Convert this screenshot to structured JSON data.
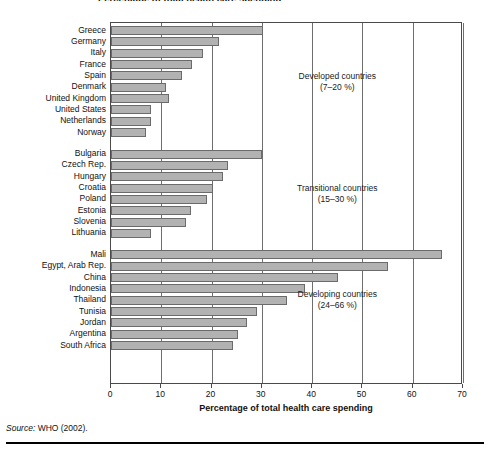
{
  "figure": {
    "title": "Percentage of total health care spending",
    "source_prefix": "Source:",
    "source_text": " WHO (2002)."
  },
  "axis": {
    "x_title": "Percentage of total health care spending",
    "x_ticks": [
      "0",
      "10",
      "20",
      "30",
      "40",
      "50",
      "60",
      "70"
    ]
  },
  "annotations": [
    {
      "line1": "Developed countries",
      "line2": "(7–20 %)"
    },
    {
      "line1": "Transitional countries",
      "line2": "(15–30 %)"
    },
    {
      "line1": "Developing countries",
      "line2": "(24–66 %)"
    }
  ],
  "chart_data": {
    "type": "bar",
    "orientation": "horizontal",
    "title": "Percentage of total health care spending",
    "xlabel": "Percentage of total health care spending",
    "ylabel": "",
    "xlim": [
      0,
      70
    ],
    "grid": true,
    "legend": "none",
    "bar_color": "#b2b2b2",
    "bar_border_color": "#6b6b6b",
    "groups": [
      {
        "name": "Developed countries",
        "range_label": "(7–20 %)",
        "categories": [
          "Greece",
          "Germany",
          "Italy",
          "France",
          "Spain",
          "Denmark",
          "United Kingdom",
          "United States",
          "Netherlands",
          "Norway"
        ],
        "values": [
          30.2,
          21.5,
          18.2,
          16.2,
          14.2,
          11.0,
          11.6,
          8.0,
          8.0,
          7.0
        ]
      },
      {
        "name": "Transitional countries",
        "range_label": "(15–30 %)",
        "categories": [
          "Bulgaria",
          "Czech Rep.",
          "Hungary",
          "Croatia",
          "Poland",
          "Estonia",
          "Slovenia",
          "Lithuania"
        ],
        "values": [
          30.0,
          23.2,
          22.2,
          20.2,
          19.0,
          16.0,
          15.0,
          8.0
        ]
      },
      {
        "name": "Developing countries",
        "range_label": "(24–66 %)",
        "categories": [
          "Mali",
          "Egypt, Arab Rep.",
          "China",
          "Indonesia",
          "Thailand",
          "Tunisia",
          "Jordan",
          "Argentina",
          "South Africa"
        ],
        "values": [
          65.8,
          55.0,
          45.2,
          38.5,
          35.0,
          29.0,
          27.0,
          25.3,
          24.2
        ]
      }
    ]
  }
}
